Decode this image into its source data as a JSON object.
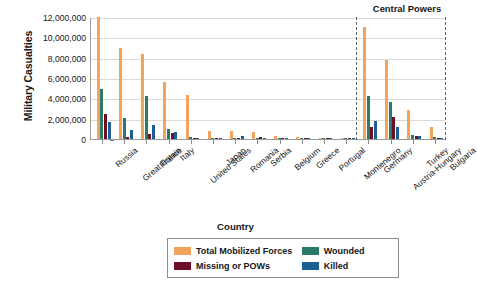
{
  "chart_data": {
    "type": "bar",
    "title": "",
    "xlabel": "Country",
    "ylabel": "Military Casualties",
    "ylim": [
      0,
      12000000
    ],
    "yticks": [
      0,
      2000000,
      4000000,
      6000000,
      8000000,
      10000000,
      12000000
    ],
    "ytick_labels": [
      "0",
      "2,000,000",
      "4,000,000",
      "6,000,000",
      "8,000,000",
      "10,000,000",
      "12,000,000"
    ],
    "grid": true,
    "legend_position": "bottom",
    "annotations": [
      {
        "text": "Central Powers",
        "note": "label above dashed-bounded region at right covering Germany through Bulgaria"
      }
    ],
    "categories": [
      "Russia",
      "Great Britain",
      "France",
      "Italy",
      "United States",
      "Japan",
      "Romania",
      "Serbia",
      "Belgium",
      "Greece",
      "Portugal",
      "Montenegro",
      "Germany",
      "Austria-Hungary",
      "Turkey",
      "Bulgaria"
    ],
    "series": [
      {
        "name": "Total Mobilized Forces",
        "color": "#f5a25c",
        "values": [
          12000000,
          8904467,
          8410000,
          5615000,
          4355000,
          800000,
          750000,
          707343,
          267000,
          230000,
          100000,
          50000,
          11000000,
          7800000,
          2850000,
          1200000
        ]
      },
      {
        "name": "Wounded",
        "color": "#2b7a68",
        "values": [
          4950000,
          2090212,
          4266000,
          947000,
          204002,
          907,
          120000,
          133148,
          44686,
          21000,
          13751,
          10000,
          4216058,
          3620000,
          400000,
          152390
        ]
      },
      {
        "name": "Missing or POWs",
        "color": "#6d0f28",
        "values": [
          2500000,
          191652,
          537000,
          600000,
          4500,
          3,
          80000,
          152958,
          34659,
          1000,
          12318,
          7000,
          1152800,
          2200000,
          250000,
          27029
        ]
      },
      {
        "name": "Killed",
        "color": "#1c5f91",
        "values": [
          1700000,
          908371,
          1357800,
          650000,
          116516,
          300,
          335706,
          45000,
          13716,
          5000,
          7222,
          3000,
          1773700,
          1200000,
          325000,
          87500
        ]
      }
    ]
  },
  "axes": {
    "y_title": "Military Casualties",
    "x_title": "Country"
  },
  "annotation": {
    "central_powers": "Central Powers"
  },
  "legend": {
    "entries": [
      {
        "label": "Total Mobilized Forces",
        "color": "#f5a25c"
      },
      {
        "label": "Wounded",
        "color": "#2b7a68"
      },
      {
        "label": "Missing or POWs",
        "color": "#6d0f28"
      },
      {
        "label": "Killed",
        "color": "#1c5f91"
      }
    ]
  }
}
